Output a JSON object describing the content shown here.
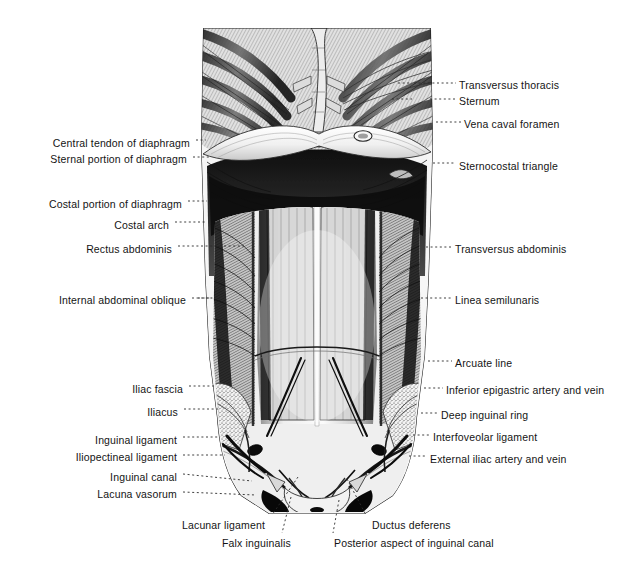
{
  "figure": {
    "kind": "anatomical-illustration",
    "style": "monochrome engraving",
    "background_color": "#ffffff",
    "ink_color": "#141414"
  },
  "labels_left": [
    {
      "id": "central-tendon-of-diaphragm",
      "text": "Central tendon of diaphragm",
      "x": 31,
      "y": 137,
      "anchor_x": 201,
      "anchor_y": 140
    },
    {
      "id": "sternal-portion-of-diaphragm",
      "text": "Sternal portion of diaphragm",
      "x": 31,
      "y": 153,
      "anchor_x": 205,
      "anchor_y": 157
    },
    {
      "id": "costal-portion-of-diaphragm",
      "text": "Costal portion of diaphragm",
      "x": 37,
      "y": 198,
      "anchor_x": 203,
      "anchor_y": 201
    },
    {
      "id": "costal-arch",
      "text": "Costal arch",
      "x": 117,
      "y": 219,
      "anchor_x": 203,
      "anchor_y": 222
    },
    {
      "id": "rectus-abdominis",
      "text": "Rectus abdominis",
      "x": 85,
      "y": 243,
      "anchor_x": 240,
      "anchor_y": 246
    },
    {
      "id": "internal-abdominal-oblique",
      "text": "Internal abdominal oblique",
      "x": 52,
      "y": 294,
      "anchor_x": 218,
      "anchor_y": 298
    },
    {
      "id": "iliac-fascia",
      "text": "Iliac fascia",
      "x": 132,
      "y": 383,
      "anchor_x": 212,
      "anchor_y": 386
    },
    {
      "id": "iliacus",
      "text": "Iliacus",
      "x": 155,
      "y": 406,
      "anchor_x": 215,
      "anchor_y": 409
    },
    {
      "id": "inguinal-ligament",
      "text": "Inguinal ligament",
      "x": 86,
      "y": 434,
      "anchor_x": 215,
      "anchor_y": 437
    },
    {
      "id": "iliopectineal-ligament",
      "text": "Iliopectineal ligament",
      "x": 62,
      "y": 451,
      "anchor_x": 221,
      "anchor_y": 455
    },
    {
      "id": "inguinal-canal",
      "text": "Inguinal canal",
      "x": 107,
      "y": 471,
      "anchor_x": 248,
      "anchor_y": 479
    },
    {
      "id": "lacuna-vasorum",
      "text": "Lacuna vasorum",
      "x": 96,
      "y": 488,
      "anchor_x": 252,
      "anchor_y": 492
    }
  ],
  "labels_right": [
    {
      "id": "transversus-thoracis",
      "text": "Transversus thoracis",
      "x": 459,
      "y": 79,
      "anchor_x": 424,
      "anchor_y": 83
    },
    {
      "id": "sternum",
      "text": "Sternum",
      "x": 459,
      "y": 95,
      "anchor_x": 436,
      "anchor_y": 99
    },
    {
      "id": "vena-caval-foramen",
      "text": "Vena caval foramen",
      "x": 464,
      "y": 118,
      "anchor_x": 440,
      "anchor_y": 122
    },
    {
      "id": "sternocostal-triangle",
      "text": "Sternocostal triangle",
      "x": 459,
      "y": 160,
      "anchor_x": 437,
      "anchor_y": 163
    },
    {
      "id": "transversus-abdominis",
      "text": "Transversus abdominis",
      "x": 455,
      "y": 243,
      "anchor_x": 430,
      "anchor_y": 247
    },
    {
      "id": "linea-semilunaris",
      "text": "Linea semilunaris",
      "x": 455,
      "y": 294,
      "anchor_x": 425,
      "anchor_y": 298
    },
    {
      "id": "arcuate-line",
      "text": "Arcuate line",
      "x": 455,
      "y": 357,
      "anchor_x": 430,
      "anchor_y": 361
    },
    {
      "id": "inferior-epigastric-artery-and-vein",
      "text": "Inferior epigastric artery and vein",
      "x": 446,
      "y": 384,
      "anchor_x": 427,
      "anchor_y": 388
    },
    {
      "id": "deep-inguinal-ring",
      "text": "Deep inguinal ring",
      "x": 441,
      "y": 409,
      "anchor_x": 424,
      "anchor_y": 413
    },
    {
      "id": "interfoveolar-ligament",
      "text": "Interfoveolar ligament",
      "x": 433,
      "y": 431,
      "anchor_x": 416,
      "anchor_y": 435
    },
    {
      "id": "external-iliac-artery-and-vein",
      "text": "External iliac artery and vein",
      "x": 430,
      "y": 453,
      "anchor_x": 411,
      "anchor_y": 456
    }
  ],
  "labels_bottom": [
    {
      "id": "lacunar-ligament",
      "text": "Lacunar ligament",
      "x": 182,
      "y": 519,
      "anchor_x": 298,
      "anchor_y": 477,
      "align": "left"
    },
    {
      "id": "falx-inguinalis",
      "text": "Falx inguinalis",
      "x": 222,
      "y": 537,
      "anchor_x": 291,
      "anchor_y": 497,
      "align": "left"
    },
    {
      "id": "ductus-deferens",
      "text": "Ductus deferens",
      "x": 372,
      "y": 519,
      "anchor_x": 347,
      "anchor_y": 479,
      "align": "left"
    },
    {
      "id": "posterior-aspect-of-inguinal-canal",
      "text": "Posterior aspect of inguinal canal",
      "x": 334,
      "y": 537,
      "anchor_x": 339,
      "anchor_y": 500,
      "align": "left"
    }
  ]
}
